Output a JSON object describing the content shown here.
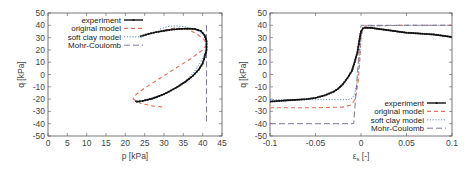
{
  "colors": {
    "experiment": "#111111",
    "original_model": "#e0735a",
    "soft_clay_model": "#5a8fc8",
    "mohr_coulomb": "#7a7a9a",
    "axis": "#555555"
  },
  "chart_data": [
    {
      "type": "line",
      "title": "",
      "xlabel": "p [kPa]",
      "ylabel": "q [kPa]",
      "xlim": [
        0,
        45
      ],
      "ylim": [
        -50,
        50
      ],
      "xticks": [
        "0",
        "5",
        "10",
        "15",
        "20",
        "25",
        "30",
        "35",
        "40",
        "45"
      ],
      "yticks": [
        "50",
        "40",
        "30",
        "20",
        "10",
        "0",
        "-10",
        "-20",
        "-30",
        "-40",
        "-50"
      ],
      "grid": false,
      "legend_position": "top-left",
      "legend": [
        "experiment",
        "original model",
        "soft clay model",
        "Mohr-Coulomb"
      ],
      "series": [
        {
          "name": "experiment",
          "style": "solid-with-points",
          "x": [
            24,
            26,
            28,
            30,
            32,
            34,
            36,
            38,
            39.5,
            40.5,
            41,
            41,
            40.5,
            40,
            39,
            37.5,
            35.5,
            33,
            30,
            27,
            24.5,
            23,
            22.5
          ],
          "y": [
            31,
            33,
            34.5,
            35.5,
            36.5,
            37,
            37.3,
            37,
            35.5,
            32,
            27,
            20,
            14,
            9,
            4,
            -1,
            -6,
            -11,
            -16,
            -19.5,
            -21.5,
            -22,
            -21.5
          ]
        },
        {
          "name": "original model",
          "style": "dashed",
          "x": [
            30,
            33,
            36,
            38.5,
            40.5,
            41,
            40,
            37,
            33,
            29,
            25,
            22.5,
            22,
            24,
            27,
            30
          ],
          "y": [
            36,
            38,
            37,
            33,
            28,
            24,
            20,
            13,
            5,
            -3,
            -11,
            -17,
            -20,
            -23.5,
            -25.5,
            -26.5
          ]
        },
        {
          "name": "soft clay model",
          "style": "dotted",
          "x": [
            29,
            31,
            33,
            35,
            37,
            39,
            40.5,
            41,
            40.5,
            39.5,
            38,
            36,
            33.5,
            31,
            28.5,
            26,
            23.5,
            22.5
          ],
          "y": [
            37,
            39,
            39.5,
            39,
            37.5,
            35,
            31,
            25,
            17,
            10,
            3,
            -4,
            -10,
            -15,
            -18.5,
            -21,
            -22,
            -21.5
          ]
        },
        {
          "name": "Mohr-Coulomb",
          "style": "long-dashed",
          "x": [
            41,
            41
          ],
          "y": [
            40,
            -40
          ]
        }
      ]
    },
    {
      "type": "line",
      "title": "",
      "xlabel": "ε_s [-]",
      "ylabel": "q [kPa]",
      "xlim": [
        -0.1,
        0.1
      ],
      "ylim": [
        -50,
        50
      ],
      "xticks": [
        "-0.1",
        "-0.05",
        "0",
        "0.05",
        "0.1"
      ],
      "yticks": [
        "50",
        "40",
        "30",
        "20",
        "10",
        "0",
        "-10",
        "-20",
        "-30",
        "-40",
        "-50"
      ],
      "grid": false,
      "legend_position": "bottom-right",
      "legend": [
        "experiment",
        "original model",
        "soft clay model",
        "Mohr-Coulomb"
      ],
      "series": [
        {
          "name": "experiment",
          "style": "solid-with-points",
          "x": [
            -0.1,
            -0.09,
            -0.08,
            -0.07,
            -0.06,
            -0.05,
            -0.04,
            -0.03,
            -0.025,
            -0.02,
            -0.015,
            -0.01,
            -0.007,
            -0.004,
            -0.002,
            0,
            0.002,
            0.005,
            0.01,
            0.02,
            0.03,
            0.04,
            0.05,
            0.06,
            0.07,
            0.08,
            0.09,
            0.1
          ],
          "y": [
            -22,
            -21.5,
            -21,
            -20.5,
            -20,
            -19,
            -17,
            -14,
            -11.5,
            -8,
            -3,
            3,
            10,
            18,
            27,
            35,
            37.5,
            38,
            38,
            37,
            36,
            35,
            34,
            33.5,
            33,
            32.5,
            31.5,
            30.5
          ]
        },
        {
          "name": "original model",
          "style": "dashed",
          "x": [
            -0.1,
            -0.05,
            -0.02,
            -0.012,
            -0.008,
            -0.005,
            -0.003,
            -0.001,
            0,
            0.002,
            0.005,
            0.05,
            0.1
          ],
          "y": [
            -27,
            -27,
            -26.5,
            -25,
            -22,
            -15,
            -5,
            15,
            30,
            37,
            39.5,
            40,
            40
          ]
        },
        {
          "name": "soft clay model",
          "style": "dotted",
          "x": [
            -0.1,
            -0.05,
            -0.015,
            -0.01,
            -0.007,
            -0.004,
            -0.002,
            0,
            0.002,
            0.005,
            0.05,
            0.1
          ],
          "y": [
            -20.5,
            -20.5,
            -20.5,
            -19.5,
            -16,
            -5,
            10,
            30,
            37,
            39.5,
            40,
            40
          ]
        },
        {
          "name": "Mohr-Coulomb",
          "style": "long-dashed",
          "x": [
            -0.1,
            -0.008,
            0,
            0.1
          ],
          "y": [
            -40,
            -40,
            40,
            40
          ]
        }
      ]
    }
  ]
}
